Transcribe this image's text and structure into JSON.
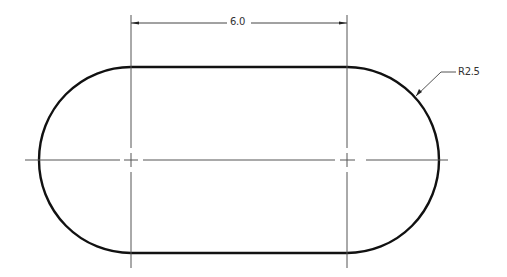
{
  "drawing": {
    "type": "slot / obround technical drawing",
    "dimensions": {
      "center_distance": "6.0",
      "radius": "R2.5"
    },
    "colors": {
      "outline": "#111111",
      "dimension": "#444444",
      "centerline": "#555555",
      "background": "#ffffff"
    }
  }
}
